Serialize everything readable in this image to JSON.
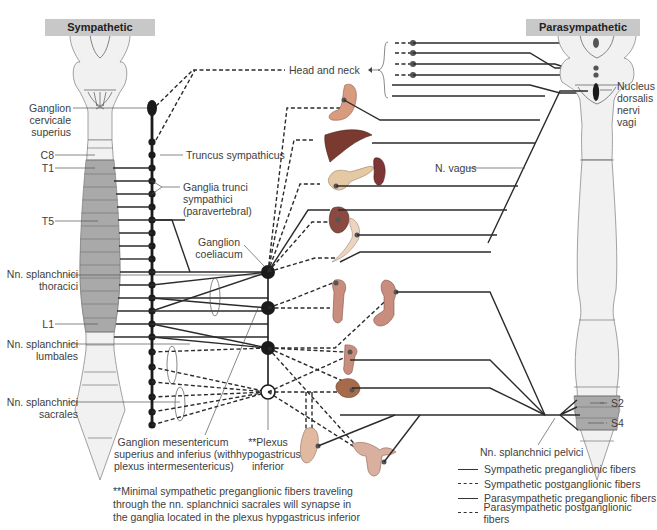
{
  "headers": {
    "sympathetic": "Sympathetic",
    "parasympathetic": "Parasympathetic"
  },
  "labels": {
    "ganglion_cervicale": [
      "Ganglion",
      "cervicale",
      "superius"
    ],
    "c8": "C8",
    "t1": "T1",
    "t5": "T5",
    "l1": "L1",
    "truncus": "Truncus sympathicus",
    "ganglia_trunci": [
      "Ganglia trunci",
      "sympathici",
      "(paravertebral)"
    ],
    "ganglion_coeliacum": [
      "Ganglion",
      "coeliacum"
    ],
    "splanchnici_thoracici": [
      "Nn. splanchnici",
      "thoracici"
    ],
    "splanchnici_lumbales": [
      "Nn. splanchnici",
      "lumbales"
    ],
    "splanchnici_sacrales": [
      "Nn. splanchnici",
      "sacrales"
    ],
    "ganglion_mesentericum": [
      "Ganglion mesentericum",
      "superius and inferius (with",
      "plexus intermesentericus)"
    ],
    "plexus_hypogastricus": [
      "**Plexus",
      "hypogastricus",
      "inferior"
    ],
    "head_neck": "Head and neck",
    "n_vagus": "N. vagus",
    "nucleus_dorsalis": [
      "Nucleus",
      "dorsalis",
      "nervi",
      "vagi"
    ],
    "s2": "S2",
    "s4": "S4",
    "splanchnici_pelvici": "Nn. splanchnici pelvici"
  },
  "footnote": [
    "**Minimal sympathetic preganglionic fibers traveling",
    "through the nn. splanchnici sacrales will synapse in",
    "the ganglia located in the plexus hypgastricus inferior"
  ],
  "legend": [
    {
      "label": "Sympathetic preganglionic fibers",
      "style": "solid"
    },
    {
      "label": "Sympathetic postganglionic fibers",
      "style": "dashed"
    },
    {
      "label": "Parasympathetic preganglionic fibers",
      "style": "solid"
    },
    {
      "label": "Parasympathetic postganglionic fibers",
      "style": "dashed"
    }
  ],
  "organs": [
    "eye-glands",
    "heart-lungs",
    "stomach",
    "liver",
    "pancreas",
    "spleen",
    "kidney",
    "small-intestine",
    "colon-ascending",
    "colon-descending",
    "rectum",
    "bladder",
    "male-genitals",
    "female-genitals"
  ],
  "colors": {
    "line": "#2b2b2b",
    "cord_light": "#f1f1f1",
    "cord_segment_dark": "#a9a9a9",
    "header_bg": "#c8c8c8",
    "organ_red": "#b0594a",
    "organ_tan": "#d9b89a"
  }
}
